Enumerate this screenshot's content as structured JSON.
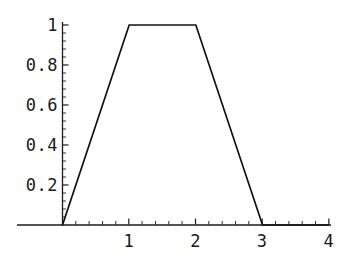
{
  "chart_data": {
    "type": "line",
    "title": "",
    "subtitle": "",
    "xlabel": "",
    "ylabel": "",
    "xlim": [
      -0.07,
      4.1
    ],
    "ylim": [
      0,
      1.06
    ],
    "grid": false,
    "legend": null,
    "x": [
      0,
      1,
      2,
      3,
      4
    ],
    "y": [
      0,
      1,
      1,
      0,
      0
    ],
    "series": [
      {
        "name": "trapezoidal membership function",
        "points": [
          {
            "x": 0,
            "y": 0
          },
          {
            "x": 1,
            "y": 1
          },
          {
            "x": 2,
            "y": 1
          },
          {
            "x": 3,
            "y": 0
          },
          {
            "x": 4,
            "y": 0
          }
        ]
      }
    ],
    "x_tick_labels": [
      "1",
      "2",
      "3",
      "4"
    ],
    "x_tick_values": [
      1,
      2,
      3,
      4
    ],
    "y_tick_labels": [
      "0.2",
      "0.4",
      "0.6",
      "0.8",
      "1"
    ],
    "y_tick_values": [
      0.2,
      0.4,
      0.6,
      0.8,
      1
    ],
    "x_minor_count": 4,
    "y_minor_count": 4,
    "line_color": "#111111",
    "axis_color": "#1a1a1a",
    "background_color": "#ffffff",
    "annotations": []
  }
}
